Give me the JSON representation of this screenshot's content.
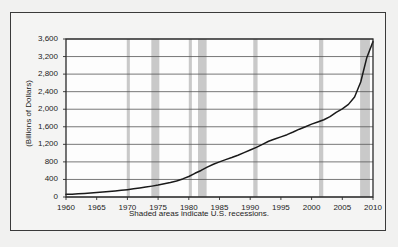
{
  "figure": {
    "caption": "Shaded areas indicate U.S. recessions.",
    "ylabel": "(Billions of Dollars)",
    "frame_color": "#3a3a3a",
    "background_color": "#f1f1f0",
    "line_color": "#1a1a1a",
    "recession_band_color": "#c9c9c9",
    "gridline_color": "#555555"
  },
  "chart_data": {
    "type": "line",
    "title": "",
    "xlabel": "",
    "ylabel": "(Billions of Dollars)",
    "annotation": "Shaded areas indicate U.S. recessions.",
    "grid": "horizontal",
    "legend": "none",
    "xlim": [
      1960,
      2010
    ],
    "ylim": [
      0,
      3600
    ],
    "ytick_labels": [
      "0",
      "400",
      "800",
      "1,200",
      "1,600",
      "2,000",
      "2,400",
      "2,800",
      "3,200",
      "3,600"
    ],
    "ytick_values": [
      0,
      400,
      800,
      1200,
      1600,
      2000,
      2400,
      2800,
      3200,
      3600
    ],
    "xtick_labels": [
      "1960",
      "1965",
      "1970",
      "1975",
      "1980",
      "1985",
      "1990",
      "1995",
      "2000",
      "2005",
      "2010"
    ],
    "xtick_values": [
      1960,
      1965,
      1970,
      1975,
      1980,
      1985,
      1990,
      1995,
      2000,
      2005,
      2010
    ],
    "x": [
      1960,
      1961,
      1962,
      1963,
      1964,
      1965,
      1966,
      1967,
      1968,
      1969,
      1970,
      1971,
      1972,
      1973,
      1974,
      1975,
      1976,
      1977,
      1978,
      1979,
      1980,
      1981,
      1982,
      1983,
      1984,
      1985,
      1986,
      1987,
      1988,
      1989,
      1990,
      1991,
      1992,
      1993,
      1994,
      1995,
      1996,
      1997,
      1998,
      1999,
      2000,
      2001,
      2002,
      2003,
      2004,
      2005,
      2006,
      2007,
      2008,
      2009,
      2010
    ],
    "values": [
      60,
      65,
      72,
      80,
      90,
      100,
      112,
      124,
      138,
      152,
      168,
      186,
      205,
      226,
      248,
      272,
      300,
      330,
      366,
      412,
      468,
      540,
      605,
      680,
      745,
      800,
      852,
      900,
      952,
      1010,
      1070,
      1130,
      1200,
      1270,
      1320,
      1370,
      1420,
      1480,
      1545,
      1600,
      1660,
      1710,
      1760,
      1830,
      1930,
      2010,
      2110,
      2280,
      2620,
      3180,
      3540
    ],
    "series": [
      {
        "name": "Series",
        "units": "Billions of Dollars",
        "color": "#1a1a1a"
      }
    ],
    "recessions": [
      {
        "label": "1969-1970",
        "start": 1969.9,
        "end": 1970.4
      },
      {
        "label": "1973-1975",
        "start": 1973.9,
        "end": 1975.2
      },
      {
        "label": "1980",
        "start": 1980.0,
        "end": 1980.5
      },
      {
        "label": "1981-1982",
        "start": 1981.5,
        "end": 1982.9
      },
      {
        "label": "1990-1991",
        "start": 1990.5,
        "end": 1991.2
      },
      {
        "label": "2001",
        "start": 2001.2,
        "end": 2001.9
      },
      {
        "label": "2007-2009",
        "start": 2007.9,
        "end": 2009.5
      }
    ]
  }
}
